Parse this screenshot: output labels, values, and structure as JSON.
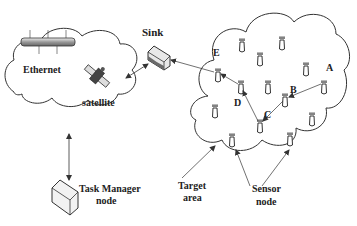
{
  "diagram": {
    "type": "network-architecture",
    "labels": {
      "sink": "Sink",
      "ethernet": "Ethernet",
      "satellite": "satellite",
      "task_manager_line1": "Task Manager",
      "task_manager_line2": "node",
      "target_area_line1": "Target",
      "target_area_line2": "area",
      "sensor_node_line1": "Sensor",
      "sensor_node_line2": "node"
    },
    "route_nodes": {
      "A": "A",
      "B": "B",
      "C": "C",
      "D": "D",
      "E": "E"
    },
    "route": [
      "A",
      "B",
      "C",
      "D",
      "E",
      "Sink"
    ],
    "colors": {
      "line": "#333333",
      "text": "#222222",
      "device_fill": "#e8e8e8",
      "device_shade": "#6a6a6a"
    }
  }
}
